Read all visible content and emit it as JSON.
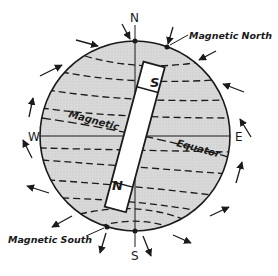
{
  "figure": {
    "labels": {
      "north": "N",
      "south": "S",
      "east": "E",
      "west": "W",
      "magnetic_north": "Magnetic North",
      "magnetic_south": "Magnetic South",
      "magnetic": "Magnetic",
      "equator": "Equator",
      "magnet_top_pole": "S",
      "magnet_bottom_pole": "N"
    },
    "colors": {
      "globe_fill": "#d6d6d6",
      "line": "#1a1a1a",
      "magnet_fill": "#ffffff",
      "background": "#ffffff"
    }
  }
}
